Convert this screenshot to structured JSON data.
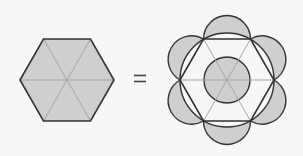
{
  "diagram": {
    "left_figure": {
      "shape": "regular-hexagon",
      "subdivision": "6 triangles from center",
      "fill": "#cfcfcf"
    },
    "operator": "=",
    "right_figure": {
      "shapes": [
        "regular-hexagon",
        "circumscribed-circle",
        "6 outward semicircles on sides",
        "inner circle"
      ],
      "shaded_regions": [
        "6 lunes",
        "inner circle"
      ],
      "fill": "#cfcfcf"
    },
    "colors": {
      "background": "#f7f7f7",
      "fill": "#cfcfcf",
      "stroke": "#333333",
      "spoke": "#9a9a9a"
    }
  }
}
